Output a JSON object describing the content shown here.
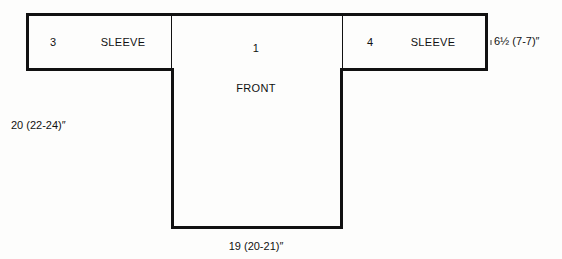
{
  "diagram": {
    "type": "garment-schematic",
    "shape": "t-shape",
    "pieces": [
      {
        "id": "sleeve-left",
        "number": "3",
        "name": "SLEEVE"
      },
      {
        "id": "front",
        "number": "1",
        "name": "FRONT"
      },
      {
        "id": "sleeve-right",
        "number": "4",
        "name": "SLEEVE"
      }
    ],
    "dimensions": {
      "sleeve_length": "6½  (7-7)″",
      "body_width": "20 (22-24)″",
      "hem_width": "19 (20-21)″"
    },
    "colors": {
      "stroke": "#111111",
      "background": "#fdfdfc",
      "text": "#111111"
    }
  }
}
